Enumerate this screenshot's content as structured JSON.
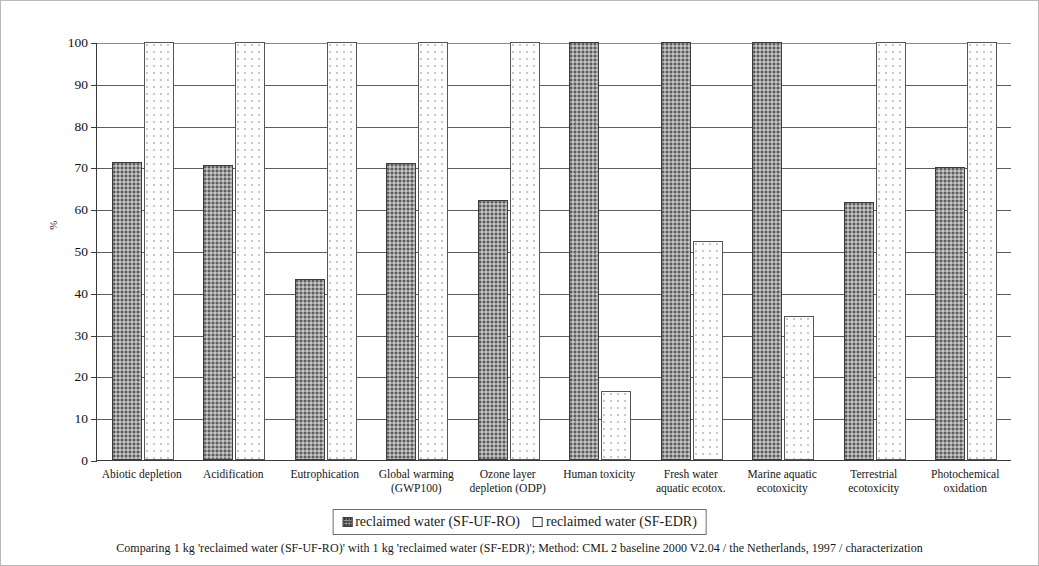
{
  "chart_data": {
    "type": "bar",
    "title": "",
    "xlabel": "",
    "ylabel": "%",
    "ylim": [
      0,
      100
    ],
    "ytick_step": 10,
    "yticks": [
      "100",
      "90",
      "80",
      "70",
      "60",
      "50",
      "40",
      "30",
      "20",
      "10",
      "0"
    ],
    "grid": true,
    "legend_position": "bottom-center",
    "categories": [
      "Abiotic depletion",
      "Acidification",
      "Eutrophication",
      "Global warming (GWP100)",
      "Ozone layer depletion (ODP)",
      "Human toxicity",
      "Fresh water aquatic ecotox.",
      "Marine aquatic ecotoxicity",
      "Terrestrial ecotoxicity",
      "Photochemical oxidation"
    ],
    "category_lines": [
      [
        "Abiotic depletion"
      ],
      [
        "Acidification"
      ],
      [
        "Eutrophication"
      ],
      [
        "Global warming",
        "(GWP100)"
      ],
      [
        "Ozone layer",
        "depletion (ODP)"
      ],
      [
        "Human toxicity"
      ],
      [
        "Fresh water",
        "aquatic ecotox."
      ],
      [
        "Marine aquatic",
        "ecotoxicity"
      ],
      [
        "Terrestrial",
        "ecotoxicity"
      ],
      [
        "Photochemical",
        "oxidation"
      ]
    ],
    "series": [
      {
        "name": "reclaimed water (SF-UF-RO)",
        "fill": "stippled-gray",
        "color": "#9a9a9a",
        "values": [
          71.2,
          70.6,
          43.3,
          71.1,
          62.2,
          100,
          100,
          100,
          61.8,
          70.2
        ]
      },
      {
        "name": "reclaimed water (SF-EDR)",
        "fill": "white-stipple",
        "color": "#ffffff",
        "values": [
          100,
          100,
          100,
          100,
          100,
          16.6,
          52.5,
          34.4,
          100,
          100
        ]
      }
    ]
  },
  "legend": {
    "items": [
      {
        "label": "reclaimed water (SF-UF-RO)",
        "swatch": "stippled-gray-swatch"
      },
      {
        "label": "reclaimed water (SF-EDR)",
        "swatch": "white-swatch"
      }
    ]
  },
  "caption": {
    "text": "Comparing 1 kg 'reclaimed water (SF-UF-RO)' with 1 kg 'reclaimed water (SF-EDR)';  Method: CML 2 baseline 2000 V2.04 /  the Netherlands, 1997 / characterization"
  }
}
